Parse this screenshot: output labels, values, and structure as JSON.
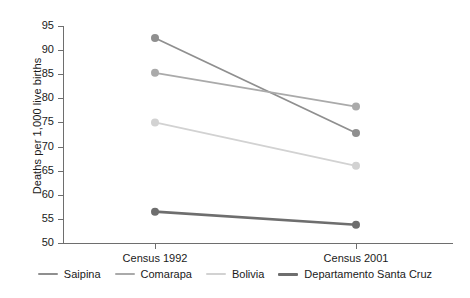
{
  "chart_data": {
    "type": "line",
    "title": "",
    "xlabel": "",
    "ylabel": "Deaths per 1,000 live births",
    "categories": [
      "Census 1992",
      "Census 2001"
    ],
    "ylim": [
      50,
      95
    ],
    "yticks": [
      50,
      55,
      60,
      65,
      70,
      75,
      80,
      85,
      90,
      95
    ],
    "ytick_labels": [
      "50",
      "55",
      "60",
      "65",
      "70",
      "75",
      "80",
      "85",
      "90",
      "95"
    ],
    "grid": false,
    "legend_position": "bottom",
    "markers": "circle",
    "series": [
      {
        "name": "Saipina",
        "values": [
          92.5,
          72.8
        ],
        "color": "#8f8f8f",
        "width": 1.8
      },
      {
        "name": "Comarapa",
        "values": [
          85.3,
          78.3
        ],
        "color": "#aaaaaa",
        "width": 1.8
      },
      {
        "name": "Bolivia",
        "values": [
          75.0,
          66.0
        ],
        "color": "#d2d2d2",
        "width": 1.8
      },
      {
        "name": "Departamento Santa Cruz",
        "values": [
          56.5,
          53.8
        ],
        "color": "#6e6e6e",
        "width": 2.6
      }
    ]
  },
  "axis": {
    "line_color": "#6e6e6e"
  }
}
